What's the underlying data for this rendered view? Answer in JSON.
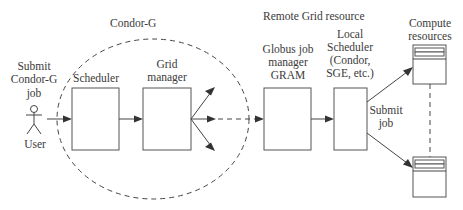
{
  "diagram": {
    "labels": {
      "condor_g": "Condor-G",
      "submit_line1": "Submit",
      "submit_line2": "Condor-G",
      "submit_line3": "job",
      "user": "User",
      "scheduler": "Scheduler",
      "grid_line1": "Grid",
      "grid_line2": "manager",
      "remote": "Remote Grid resource",
      "globus_line1": "Globus job",
      "globus_line2": "manager",
      "globus_line3": "GRAM",
      "local_line1": "Local",
      "local_line2": "Scheduler",
      "local_line3": "(Condor,",
      "local_line4": "SGE, etc.)",
      "compute_line1": "Compute",
      "compute_line2": "resources",
      "submit_job_line1": "Submit",
      "submit_job_line2": "job"
    },
    "colors": {
      "stroke": "#444444",
      "text": "#3a3a3a",
      "background": "#ffffff"
    }
  }
}
